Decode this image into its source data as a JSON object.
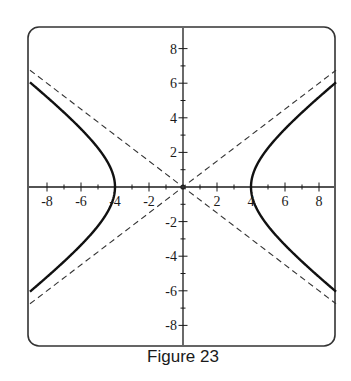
{
  "caption": "Figure 23",
  "chart_data": {
    "type": "line",
    "title": "",
    "caption": "Figure 23",
    "xlabel": "",
    "ylabel": "",
    "xlim": [
      -9,
      9
    ],
    "ylim": [
      -9,
      9
    ],
    "grid": false,
    "legend": null,
    "x_ticks": [
      -8,
      -6,
      -4,
      -2,
      2,
      4,
      6,
      8
    ],
    "y_ticks": [
      -8,
      -6,
      -4,
      -2,
      2,
      4,
      6,
      8
    ],
    "minor_tick_step": 1,
    "series": [
      {
        "name": "hyperbola",
        "equation": "x^2/16 - y^2/9 = 1",
        "style": "solid-bold",
        "vertices": [
          [
            -4,
            0
          ],
          [
            4,
            0
          ]
        ],
        "branch_endpoints": [
          [
            9,
            6.05
          ],
          [
            9,
            -6.05
          ],
          [
            -9,
            6.05
          ],
          [
            -9,
            -6.05
          ]
        ]
      },
      {
        "name": "asymptote-positive",
        "equation": "y = 3x/4",
        "style": "dashed",
        "x": [
          -9,
          9
        ],
        "y": [
          -6.75,
          6.75
        ]
      },
      {
        "name": "asymptote-negative",
        "equation": "y = -3x/4",
        "style": "dashed",
        "x": [
          -9,
          9
        ],
        "y": [
          6.75,
          -6.75
        ]
      }
    ],
    "annotations": [
      {
        "type": "point",
        "x": 0,
        "y": 0,
        "label": "origin"
      }
    ]
  },
  "colors": {
    "axis": "#1a1a1a",
    "curve": "#111111",
    "asymptote": "#333333",
    "frame": "#333333"
  }
}
